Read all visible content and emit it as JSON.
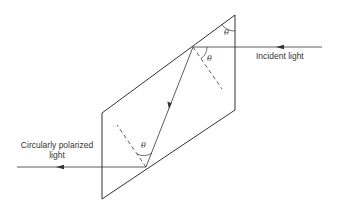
{
  "diagram": {
    "labels": {
      "incident": "Incident light",
      "output_line1": "Circularly polarized",
      "output_line2": "light",
      "angle_symbol": "θ"
    },
    "colors": {
      "stroke": "#333333",
      "background": "#ffffff"
    },
    "rhomb": {
      "vertices": [
        [
          235,
          15
        ],
        [
          235,
          110
        ],
        [
          102,
          199
        ],
        [
          102,
          113
        ]
      ]
    },
    "rays": {
      "incident": {
        "from": [
          322,
          47
        ],
        "to": [
          193,
          47
        ]
      },
      "internal": {
        "from": [
          193,
          47
        ],
        "to": [
          146,
          167
        ]
      },
      "output": {
        "from": [
          146,
          167
        ],
        "to": [
          17,
          167
        ]
      }
    },
    "normals": [
      {
        "from": [
          193,
          47
        ],
        "to": [
          222,
          89
        ]
      },
      {
        "from": [
          146,
          167
        ],
        "to": [
          117,
          125
        ]
      }
    ],
    "angles": [
      {
        "label": "θ",
        "pos": [
          224,
          35
        ],
        "note": "apex angle at top-right vertex"
      },
      {
        "label": "θ",
        "pos": [
          209,
          60
        ],
        "note": "angle of incidence at first reflection"
      },
      {
        "label": "θ",
        "pos": [
          142,
          145
        ],
        "note": "angle of incidence at second reflection"
      }
    ]
  }
}
